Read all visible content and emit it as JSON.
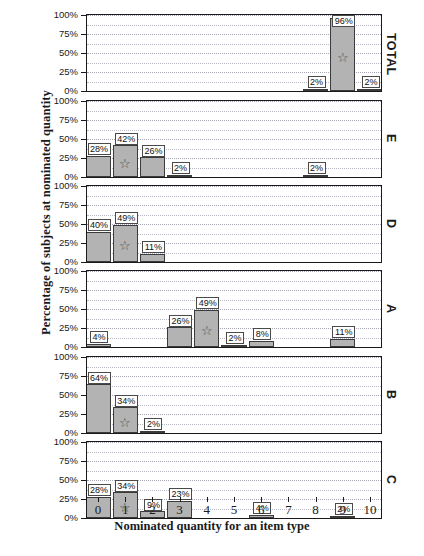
{
  "chart_data": {
    "type": "bar",
    "title": "",
    "xlabel": "Nominated quantity for an item type",
    "ylabel": "Percentage of subjects at nominated quantity",
    "x": [
      0,
      1,
      2,
      3,
      4,
      5,
      6,
      7,
      8,
      9,
      10
    ],
    "xtick_labels": [
      "0",
      "1",
      "2",
      "3",
      "4",
      "5",
      "6",
      "7",
      "8",
      "9",
      "10"
    ],
    "ytick_labels": [
      "0%",
      "25%",
      "50%",
      "75%",
      "100%"
    ],
    "ytick_values": [
      0,
      25,
      50,
      75,
      100
    ],
    "ylim": [
      0,
      100
    ],
    "xlim": [
      -0.5,
      10.5
    ],
    "grid": true,
    "grid_axis": "y",
    "legend": "none",
    "bar_color": "#b3b3b3",
    "bar_edge_color": "#3b3b3b",
    "label_box_color": "#ffffff",
    "star_marker": "☆",
    "star_meaning": "modal / starred category",
    "panel_label_position": "right",
    "panels": [
      {
        "label": "TOTAL",
        "categories": [
          0,
          1,
          2,
          3,
          4,
          5,
          6,
          7,
          8,
          9,
          10
        ],
        "values": [
          0,
          0,
          0,
          0,
          0,
          0,
          0,
          0,
          2,
          96,
          2
        ],
        "data_labels": [
          {
            "x": 8,
            "text": "2%"
          },
          {
            "x": 9,
            "text": "96%"
          },
          {
            "x": 10,
            "text": "2%"
          }
        ],
        "star_at": 9
      },
      {
        "label": "E",
        "categories": [
          0,
          1,
          2,
          3,
          4,
          5,
          6,
          7,
          8,
          9,
          10
        ],
        "values": [
          28,
          42,
          26,
          2,
          0,
          0,
          0,
          0,
          2,
          0,
          0
        ],
        "data_labels": [
          {
            "x": 0,
            "text": "28%"
          },
          {
            "x": 1,
            "text": "42%"
          },
          {
            "x": 2,
            "text": "26%"
          },
          {
            "x": 3,
            "text": "2%"
          },
          {
            "x": 8,
            "text": "2%"
          }
        ],
        "star_at": 1
      },
      {
        "label": "D",
        "categories": [
          0,
          1,
          2,
          3,
          4,
          5,
          6,
          7,
          8,
          9,
          10
        ],
        "values": [
          40,
          49,
          11,
          0,
          0,
          0,
          0,
          0,
          0,
          0,
          0
        ],
        "data_labels": [
          {
            "x": 0,
            "text": "40%"
          },
          {
            "x": 1,
            "text": "49%"
          },
          {
            "x": 2,
            "text": "11%"
          }
        ],
        "star_at": 1
      },
      {
        "label": "A",
        "categories": [
          0,
          1,
          2,
          3,
          4,
          5,
          6,
          7,
          8,
          9,
          10
        ],
        "values": [
          4,
          0,
          0,
          26,
          49,
          2,
          8,
          0,
          0,
          11,
          0
        ],
        "data_labels": [
          {
            "x": 0,
            "text": "4%"
          },
          {
            "x": 3,
            "text": "26%"
          },
          {
            "x": 4,
            "text": "49%"
          },
          {
            "x": 5,
            "text": "2%"
          },
          {
            "x": 6,
            "text": "8%"
          },
          {
            "x": 9,
            "text": "11%"
          }
        ],
        "star_at": 4
      },
      {
        "label": "B",
        "categories": [
          0,
          1,
          2,
          3,
          4,
          5,
          6,
          7,
          8,
          9,
          10
        ],
        "values": [
          64,
          34,
          2,
          0,
          0,
          0,
          0,
          0,
          0,
          0,
          0
        ],
        "data_labels": [
          {
            "x": 0,
            "text": "64%"
          },
          {
            "x": 1,
            "text": "34%"
          },
          {
            "x": 2,
            "text": "2%"
          }
        ],
        "star_at": 1
      },
      {
        "label": "C",
        "categories": [
          0,
          1,
          2,
          3,
          4,
          5,
          6,
          7,
          8,
          9,
          10
        ],
        "values": [
          28,
          34,
          9,
          23,
          0,
          0,
          4,
          0,
          0,
          2,
          0
        ],
        "data_labels": [
          {
            "x": 0,
            "text": "28%"
          },
          {
            "x": 1,
            "text": "34%"
          },
          {
            "x": 2,
            "text": "9%"
          },
          {
            "x": 3,
            "text": "23%"
          },
          {
            "x": 6,
            "text": "4%"
          },
          {
            "x": 9,
            "text": "2%"
          }
        ],
        "star_at": 1
      }
    ]
  },
  "caption": ""
}
